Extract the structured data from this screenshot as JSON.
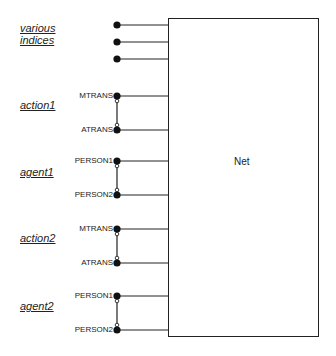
{
  "diagram": {
    "net": {
      "label": "Net",
      "box": {
        "x": 168,
        "y": 18,
        "w": 150,
        "h": 318
      }
    },
    "groups": [
      {
        "label_lines": [
          "various",
          "indices"
        ],
        "label_y": 30,
        "nodes": [
          {
            "label": "",
            "y": 25
          },
          {
            "label": "",
            "y": 42
          },
          {
            "label": "",
            "y": 59
          }
        ],
        "linked": false
      },
      {
        "label_lines": [
          "action1"
        ],
        "label_y": 107,
        "nodes": [
          {
            "label": "MTRANS",
            "y": 96
          },
          {
            "label": "ATRANS",
            "y": 130
          }
        ],
        "linked": true
      },
      {
        "label_lines": [
          "agent1"
        ],
        "label_y": 174,
        "nodes": [
          {
            "label": "PERSON1",
            "y": 161
          },
          {
            "label": "PERSON2",
            "y": 195
          }
        ],
        "linked": true
      },
      {
        "label_lines": [
          "action2"
        ],
        "label_y": 240,
        "nodes": [
          {
            "label": "MTRANS",
            "y": 229
          },
          {
            "label": "ATRANS",
            "y": 263
          }
        ],
        "linked": true
      },
      {
        "label_lines": [
          "agent2"
        ],
        "label_y": 308,
        "nodes": [
          {
            "label": "PERSON1",
            "y": 296
          },
          {
            "label": "PERSON2",
            "y": 330
          }
        ],
        "linked": true
      }
    ],
    "node_x": 117,
    "colors": {
      "line": "#222222",
      "node": "#111111",
      "background": "#ffffff"
    }
  }
}
